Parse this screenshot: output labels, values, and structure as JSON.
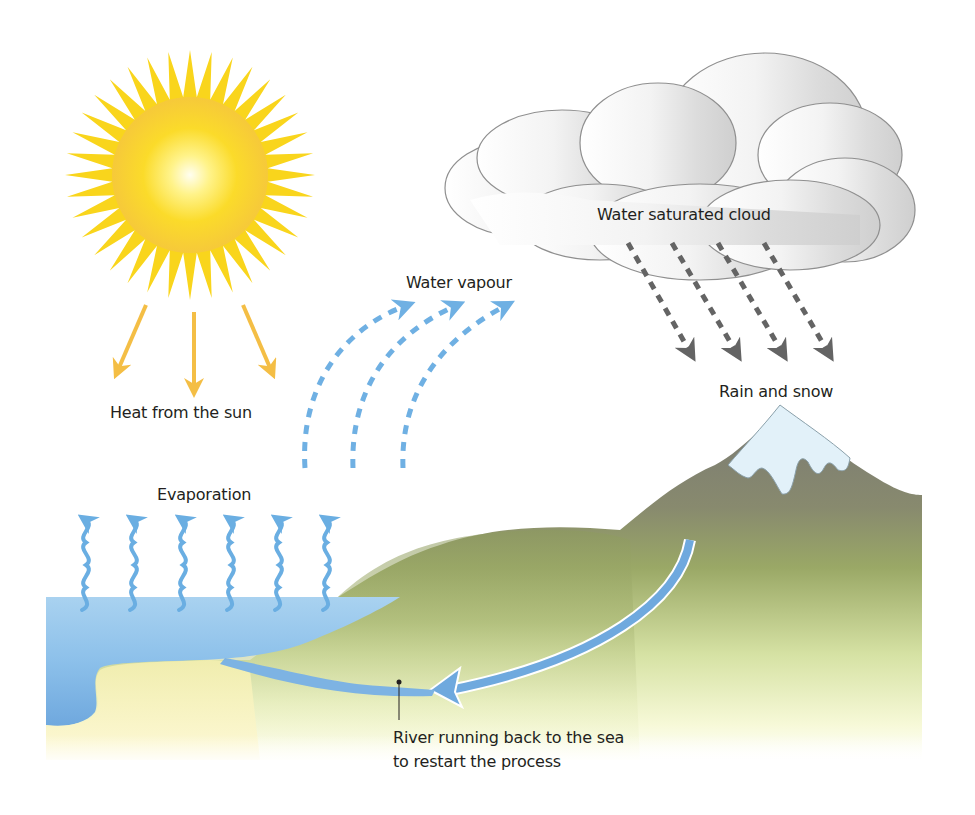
{
  "labels": {
    "heat": "Heat from the sun",
    "vapour": "Water vapour",
    "cloud": "Water saturated cloud",
    "rain": "Rain and snow",
    "evaporation": "Evaporation",
    "river_line1": "River running back to the sea",
    "river_line2": "to restart the process"
  },
  "elements": {
    "sun": {
      "rays": 36,
      "color": "#f8d21a",
      "core": "#fffbd0"
    },
    "heat_arrows": {
      "count": 3,
      "color": "#f4be45"
    },
    "vapour_arrows": {
      "count": 3,
      "color": "#6fb0e3",
      "style": "dashed"
    },
    "rain_arrows": {
      "count": 4,
      "color": "#6b6b6b",
      "style": "dashed"
    },
    "evaporation_arrows": {
      "count": 6,
      "color": "#6aaee2",
      "style": "wavy"
    },
    "sea": {
      "color": "#7eb8e6"
    },
    "land": {
      "top": "#9aa866",
      "bottom": "#fdfde8"
    },
    "mountain": {
      "color": "#7d7c78",
      "snow": "#dff0f8"
    },
    "river": {
      "color": "#6fa9de"
    }
  }
}
